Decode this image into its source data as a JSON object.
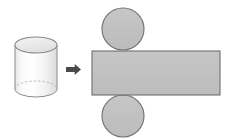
{
  "diagram": {
    "title": "Cylinder and its net",
    "colors": {
      "page_background": "#ffffff",
      "net_fill": "#c0c0c0",
      "net_stroke": "#6e6e6e",
      "cylinder_fill_top": "#fbfbfb",
      "cylinder_fill_bottom": "#e2e2e2",
      "cylinder_stroke": "#8a8a8a",
      "cylinder_top_face": "#e8e8e8",
      "arrow_fill": "#4a4a4a"
    },
    "shapes": [
      {
        "id": "cylinder",
        "label": "cylinder",
        "kind": "solid-3d",
        "x": 15,
        "y": 37,
        "width": 42,
        "height": 60,
        "ellipse_ry": 8
      },
      {
        "id": "arrow",
        "label": "transforms-into",
        "kind": "arrow",
        "direction": "right",
        "x": 66,
        "y": 64,
        "width": 15,
        "height": 11
      },
      {
        "id": "top-circle",
        "label": "top base circle",
        "kind": "circle",
        "cx": 123,
        "cy": 29,
        "r": 21
      },
      {
        "id": "lateral-rectangle",
        "label": "lateral surface rectangle",
        "kind": "rectangle",
        "x": 92,
        "y": 51,
        "width": 128,
        "height": 44
      },
      {
        "id": "bottom-circle",
        "label": "bottom base circle",
        "kind": "circle",
        "cx": 123,
        "cy": 116,
        "r": 21
      }
    ]
  }
}
